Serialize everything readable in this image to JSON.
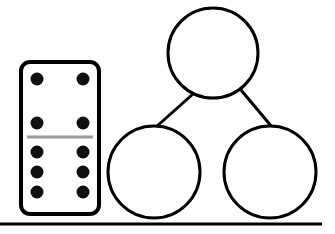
{
  "diagram": {
    "type": "number-bond",
    "colors": {
      "stroke": "#000000",
      "divider": "#9a9a9a",
      "background": "#ffffff"
    },
    "domino": {
      "top_half_pips": 4,
      "bottom_half_pips": 6,
      "total_pips": 10
    },
    "bond": {
      "whole": "",
      "part_left": "",
      "part_right": ""
    }
  }
}
